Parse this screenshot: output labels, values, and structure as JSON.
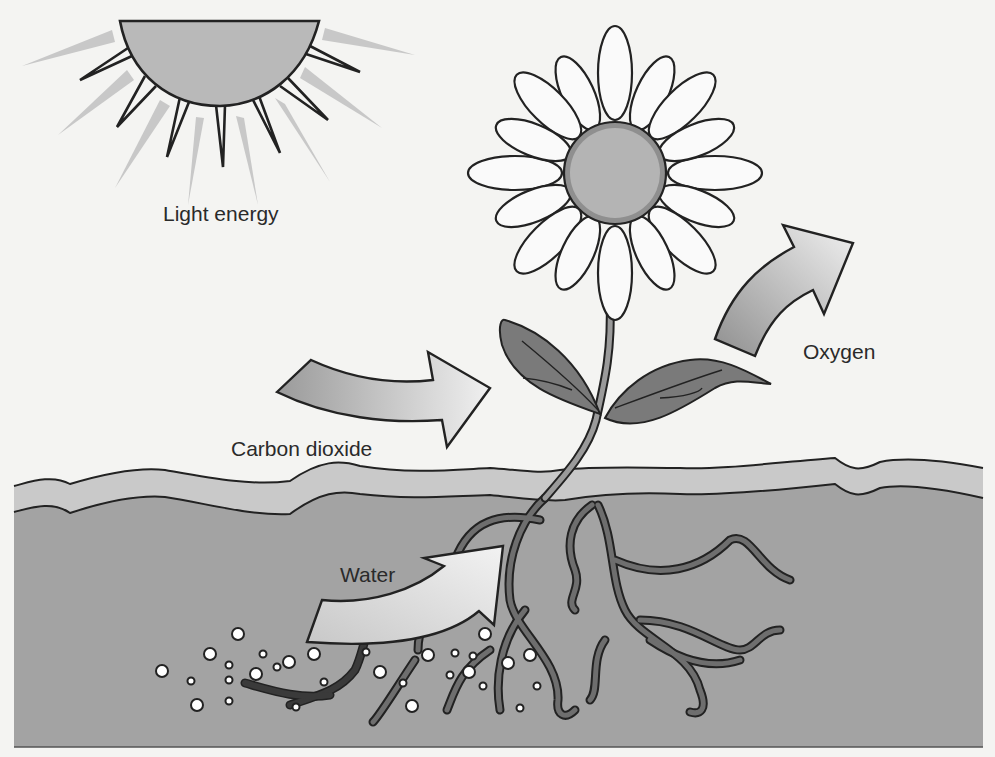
{
  "diagram": {
    "type": "photosynthesis-illustration",
    "labels": {
      "light": "Light energy",
      "carbon_dioxide": "Carbon dioxide",
      "oxygen": "Oxygen",
      "water": "Water"
    },
    "colors": {
      "background": "#f4f4f2",
      "sun_fill": "#b9b9b9",
      "ray_light": "#c8c8c8",
      "outline": "#222222",
      "soil": "#a3a3a3",
      "topsoil": "#c9c9c9",
      "flower_center": "#b4b4b4",
      "flower_center_ring": "#8f8f8f",
      "leaf": "#7a7a7a",
      "stem": "#8c8c8c",
      "root": "#5a5a5a",
      "bubble": "#ffffff"
    }
  }
}
